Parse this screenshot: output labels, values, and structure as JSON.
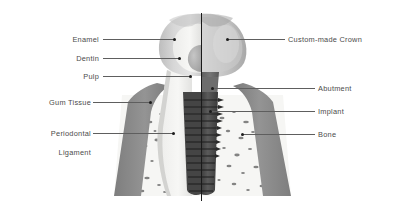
{
  "figure": {
    "background_color": "#ffffff",
    "style": "grayscale anatomical illustration",
    "divider_note": "vertical black section line splitting natural tooth (left) from implant (right)",
    "colors": {
      "background": "#ffffff",
      "leader_line": "#5e5e5e",
      "leader_dot": "#1c1c1c",
      "label_text": "#4b4b4b",
      "divider": "#1a1a1a",
      "enamel": "#d9d9d9",
      "dentin": "#f2f2f0",
      "pulp": "#b4b4b4",
      "crown": "#cfcfcf",
      "gum_tissue": "#8c8c8c",
      "bone": "#f4f4f2",
      "bone_speckle": "#6e6e6e",
      "implant": "#4a4a4a",
      "abutment": "#6b6b6b"
    }
  },
  "labels": {
    "left": [
      {
        "id": "enamel",
        "text": "Enamel",
        "lines": [
          "Enamel"
        ]
      },
      {
        "id": "dentin",
        "text": "Dentin",
        "lines": [
          "Dentin"
        ]
      },
      {
        "id": "pulp",
        "text": "Pulp",
        "lines": [
          "Pulp"
        ]
      },
      {
        "id": "gum-tissue",
        "text": "Gum Tissue",
        "lines": [
          "Gum Tissue"
        ]
      },
      {
        "id": "periodontal",
        "text": "Periodontal Ligament",
        "lines": [
          "Periodontal",
          "Ligament"
        ]
      }
    ],
    "right": [
      {
        "id": "custom-crown",
        "text": "Custom-made Crown",
        "lines": [
          "Custom-made Crown"
        ]
      },
      {
        "id": "abutment",
        "text": "Abutment",
        "lines": [
          "Abutment"
        ]
      },
      {
        "id": "implant",
        "text": "Implant",
        "lines": [
          "Implant"
        ]
      },
      {
        "id": "bone",
        "text": "Bone",
        "lines": [
          "Bone"
        ]
      }
    ]
  }
}
